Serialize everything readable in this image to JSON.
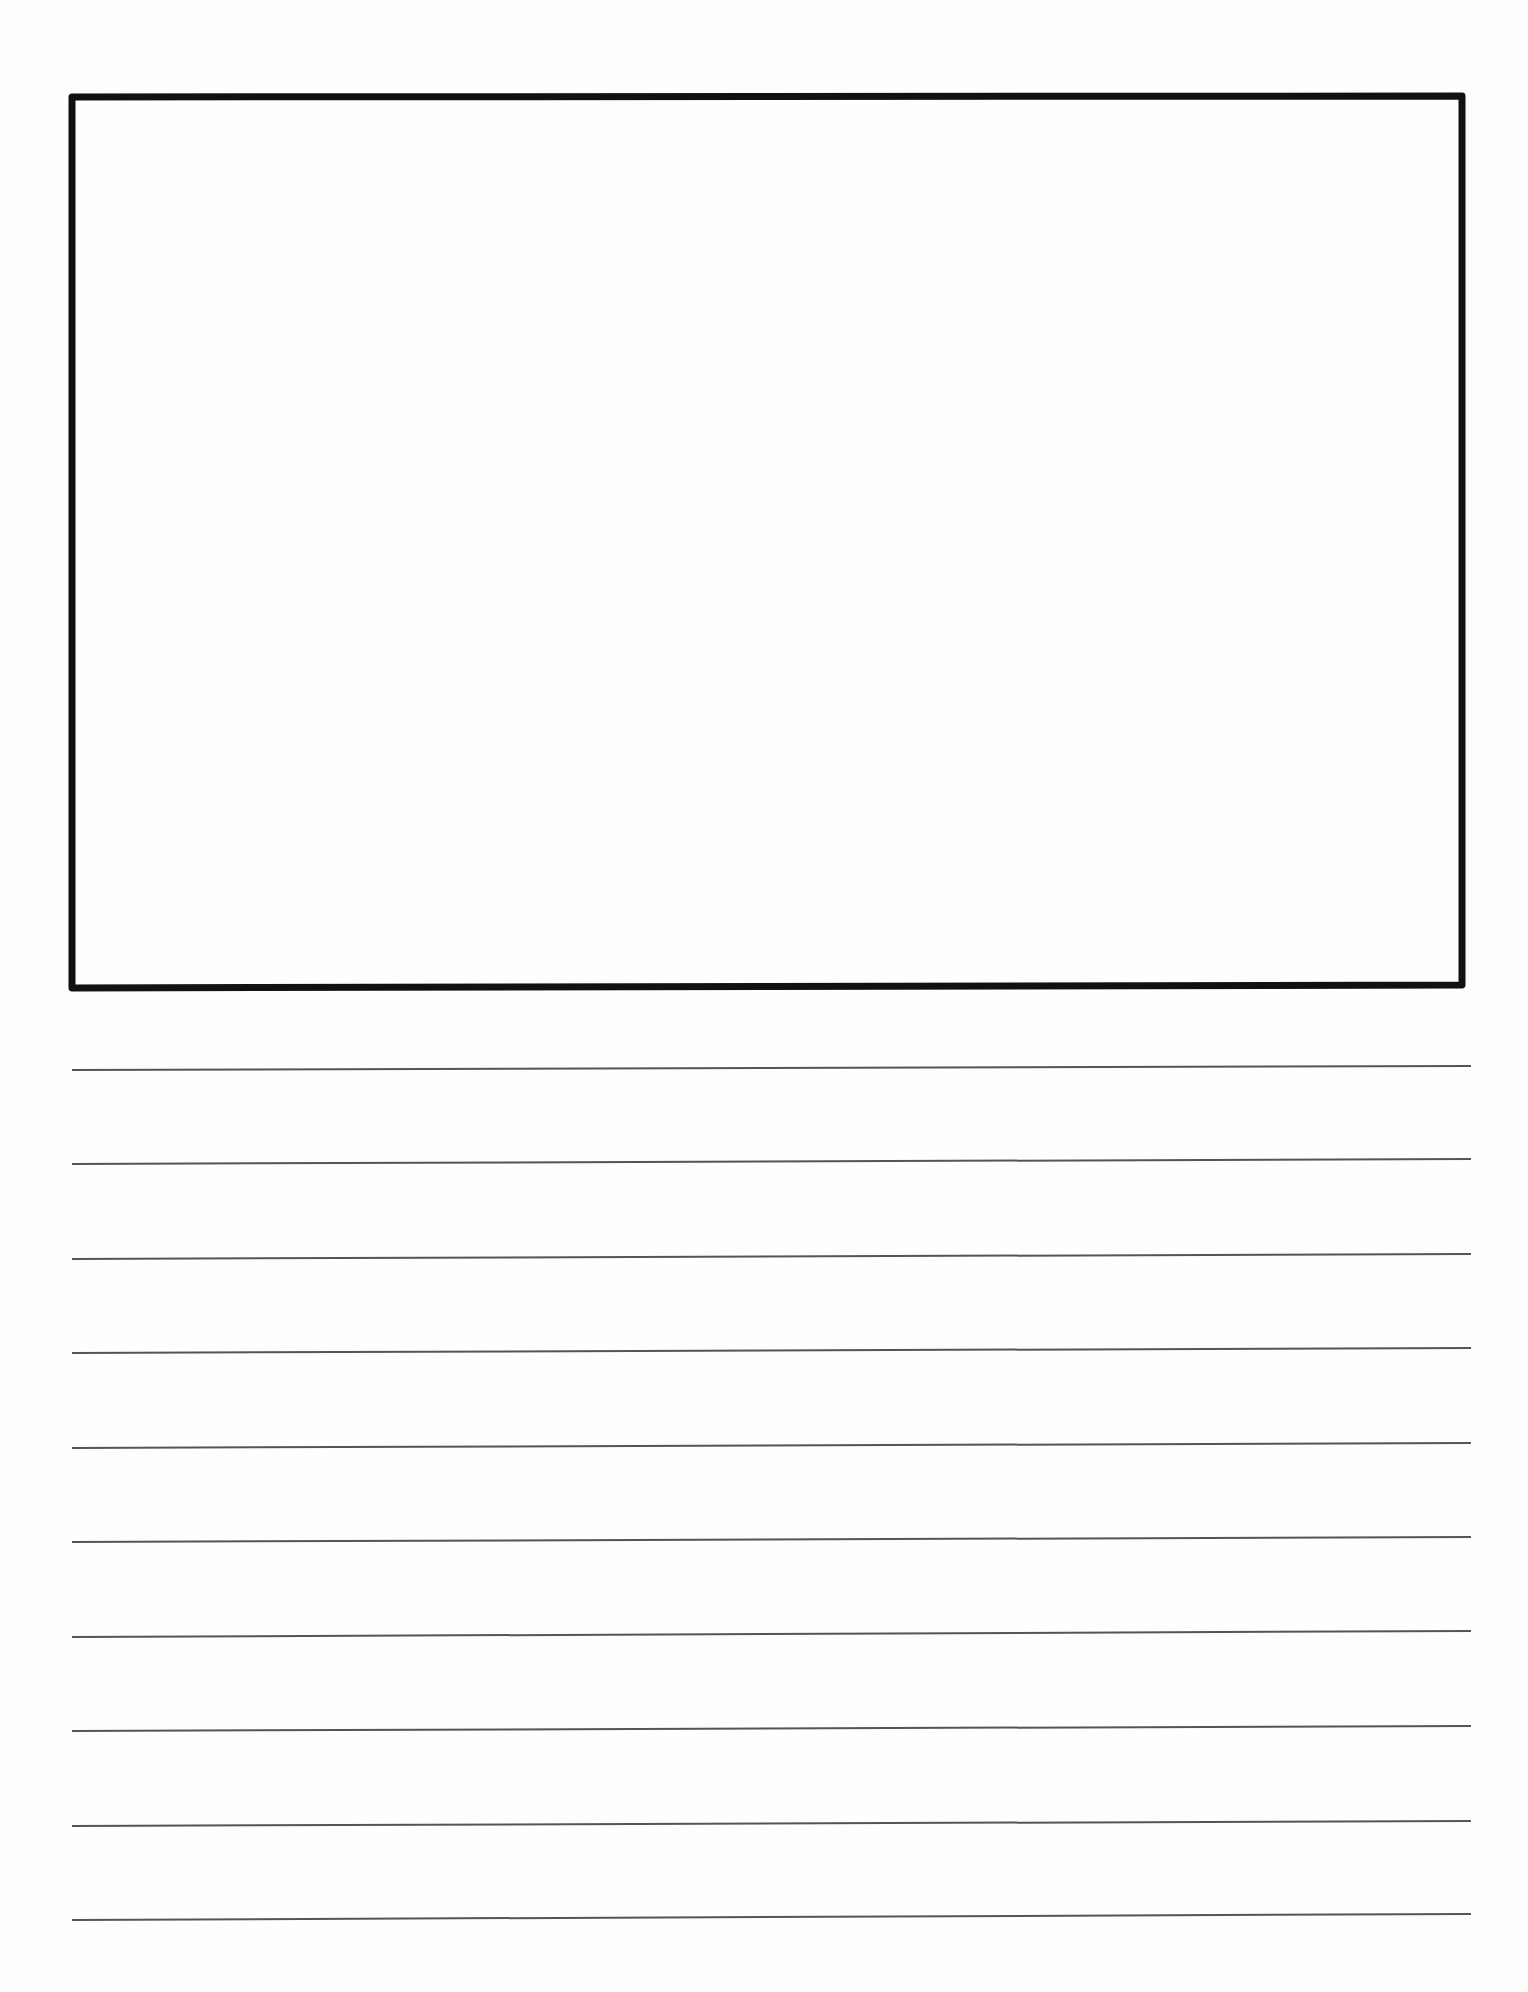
{
  "document": {
    "type": "primary-writing-paper",
    "drawing_box": {
      "corners": {
        "top_left": [
          72,
          97
        ],
        "top_right": [
          1462,
          96
        ],
        "bottom_right": [
          1462,
          985
        ],
        "bottom_left": [
          72,
          988
        ]
      },
      "stroke_width": 7,
      "stroke_color": "#111111"
    },
    "writing_lines": {
      "count": 10,
      "x_start": 72,
      "x_end": 1471,
      "stroke_width": 2,
      "stroke_color": "#555555",
      "left_y": [
        1070,
        1164,
        1259,
        1353,
        1448,
        1542,
        1637,
        1731,
        1826,
        1920
      ],
      "right_y": [
        1066,
        1159,
        1254,
        1348,
        1443,
        1537,
        1631,
        1726,
        1821,
        1914
      ]
    },
    "background_color": "#fefefe"
  }
}
